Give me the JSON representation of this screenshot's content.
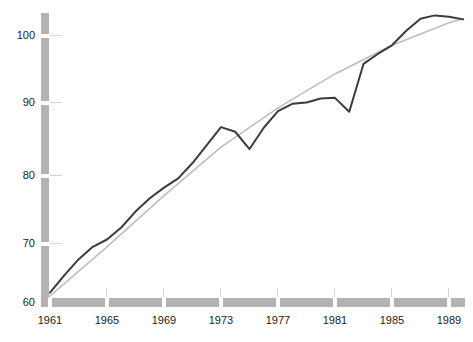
{
  "chart_data": {
    "type": "line",
    "title": "",
    "subtitle": "",
    "xlabel": "",
    "ylabel": "",
    "xlim": [
      1961,
      1990
    ],
    "ylim": [
      60,
      103.5
    ],
    "grid": false,
    "legend_position": "none",
    "x_ticks": [
      1961,
      1965,
      1969,
      1973,
      1977,
      1981,
      1985,
      1989
    ],
    "x_tick_labels": [
      "1961",
      "1965",
      "1969",
      "1973",
      "1977",
      "1981",
      "1985",
      "1989"
    ],
    "y_ticks": [
      60,
      70,
      80,
      90,
      100
    ],
    "y_tick_labels": [
      "60",
      "70",
      "80",
      "90",
      "100"
    ],
    "series": [
      {
        "name": "observed",
        "color": "#3c3c3c",
        "x": [
          1961,
          1962,
          1963,
          1964,
          1965,
          1966,
          1967,
          1968,
          1969,
          1970,
          1971,
          1972,
          1973,
          1974,
          1975,
          1976,
          1977,
          1978,
          1979,
          1980,
          1981,
          1982,
          1983,
          1984,
          1985,
          1986,
          1987,
          1988,
          1989,
          1990
        ],
        "values": [
          61.4,
          64.0,
          66.4,
          68.3,
          69.4,
          71.2,
          73.6,
          75.6,
          77.2,
          78.6,
          80.9,
          83.6,
          86.3,
          85.6,
          83.0,
          86.2,
          88.7,
          89.8,
          90.0,
          90.6,
          90.7,
          88.6,
          95.8,
          97.3,
          98.6,
          100.8,
          102.6,
          103.1,
          102.9,
          102.5
        ]
      },
      {
        "name": "trend",
        "color": "#bdbdbd",
        "x": [
          1961,
          1965,
          1969,
          1973,
          1977,
          1981,
          1985,
          1989,
          1990
        ],
        "values": [
          60.9,
          68.3,
          76.0,
          83.3,
          89.2,
          94.3,
          98.6,
          102.0,
          102.6
        ]
      }
    ]
  }
}
